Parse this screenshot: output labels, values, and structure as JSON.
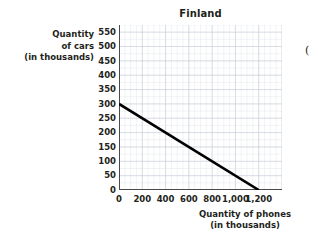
{
  "figure": {
    "title": "Finland",
    "y_axis_title_lines": [
      "Quantity",
      "of cars",
      "(in thousands)"
    ],
    "x_axis_title_lines": [
      "Quantity of phones",
      "(in thousands)"
    ],
    "edge_text": "("
  },
  "chart_data": {
    "type": "line",
    "title": "Finland",
    "xlabel": "Quantity of phones (in thousands)",
    "ylabel": "Quantity of cars (in thousands)",
    "xlim": [
      0,
      1400
    ],
    "ylim": [
      0,
      575
    ],
    "xticks": [
      0,
      200,
      400,
      600,
      800,
      1000,
      1200
    ],
    "xtick_labels": [
      "0",
      "200",
      "400",
      "600",
      "800",
      "1,000",
      "1,200"
    ],
    "yticks": [
      0,
      50,
      100,
      150,
      200,
      250,
      300,
      350,
      400,
      450,
      500,
      550
    ],
    "ytick_labels": [
      "0",
      "50",
      "100",
      "150",
      "200",
      "250",
      "300",
      "350",
      "400",
      "450",
      "500",
      "550"
    ],
    "grid": true,
    "grid_color": "#c9cfd6",
    "minor_grid": true,
    "legend": "none",
    "series": [
      {
        "name": "Production possibilities frontier",
        "color": "#000000",
        "x": [
          0,
          1200
        ],
        "y": [
          300,
          0
        ]
      }
    ],
    "annotations": []
  }
}
